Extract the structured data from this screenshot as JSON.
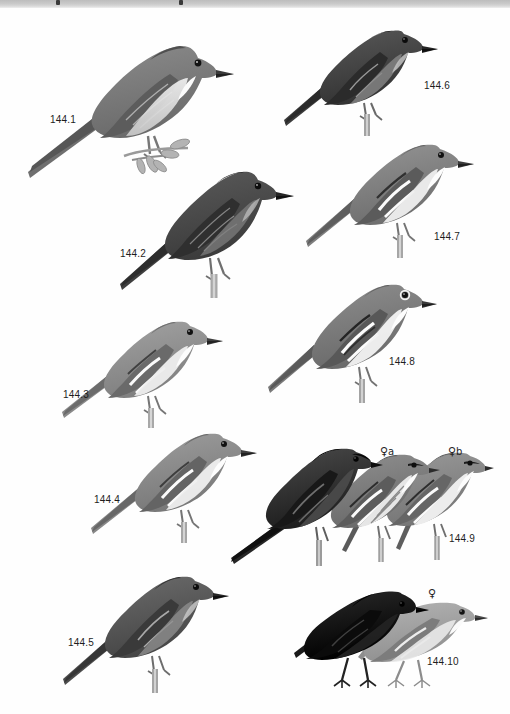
{
  "plate": {
    "title": "Bird field guide plate 144 — flycatchers",
    "background_color": "#ffffff",
    "top_strip_color": "#c9c9c9",
    "ink_dark": "#1a1a1a",
    "ink_mid": "#7d7d7d",
    "ink_light": "#cfcfcf",
    "label_color": "#1d1d1d"
  },
  "figures": [
    {
      "id": "144.1",
      "label": "144.1",
      "birds": 1,
      "tone": "mid-gray",
      "perch": "leafy-twig",
      "label_x": 50,
      "label_y": 115
    },
    {
      "id": "144.2",
      "label": "144.2",
      "birds": 1,
      "tone": "dark-gray",
      "perch": "bare-twig",
      "label_x": 120,
      "label_y": 249
    },
    {
      "id": "144.3",
      "label": "144.3",
      "birds": 1,
      "tone": "light-gray",
      "perch": "bare-twig",
      "label_x": 63,
      "label_y": 390
    },
    {
      "id": "144.4",
      "label": "144.4",
      "birds": 1,
      "tone": "light-gray",
      "perch": "bare-twig",
      "label_x": 94,
      "label_y": 495
    },
    {
      "id": "144.5",
      "label": "144.5",
      "birds": 1,
      "tone": "dark-gray",
      "perch": "bare-twig",
      "label_x": 68,
      "label_y": 638
    },
    {
      "id": "144.6",
      "label": "144.6",
      "birds": 1,
      "tone": "dark-gray",
      "perch": "bare-twig",
      "label_x": 424,
      "label_y": 81
    },
    {
      "id": "144.7",
      "label": "144.7",
      "birds": 1,
      "tone": "mid-gray",
      "perch": "bare-twig",
      "label_x": 434,
      "label_y": 232
    },
    {
      "id": "144.8",
      "label": "144.8",
      "birds": 1,
      "tone": "mid-gray",
      "perch": "bare-twig",
      "label_x": 389,
      "label_y": 357
    },
    {
      "id": "144.9",
      "label": "144.9",
      "birds": 3,
      "tone": "black-and-gray",
      "perch": "bare-twig",
      "label_x": 449,
      "label_y": 534,
      "sub_labels": [
        {
          "symbol": "♀",
          "text": "a",
          "x": 380,
          "y": 446
        },
        {
          "symbol": "♀",
          "text": "b",
          "x": 448,
          "y": 446
        }
      ]
    },
    {
      "id": "144.10",
      "label": "144.10",
      "birds": 2,
      "tone": "black-and-pale",
      "perch": "ground",
      "label_x": 427,
      "label_y": 657,
      "sub_labels": [
        {
          "symbol": "♀",
          "text": "",
          "x": 428,
          "y": 588
        }
      ]
    }
  ]
}
